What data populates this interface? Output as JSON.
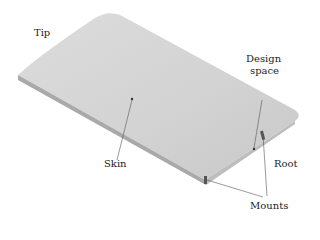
{
  "figure": {
    "labels": {
      "tip": "Tip",
      "design_space_line1": "Design",
      "design_space_line2": "space",
      "skin": "Skin",
      "root": "Root",
      "mounts": "Mounts"
    },
    "colors": {
      "surface": "#d4d4d4",
      "edge": "#a9a9a9",
      "leader": "#555555"
    }
  }
}
